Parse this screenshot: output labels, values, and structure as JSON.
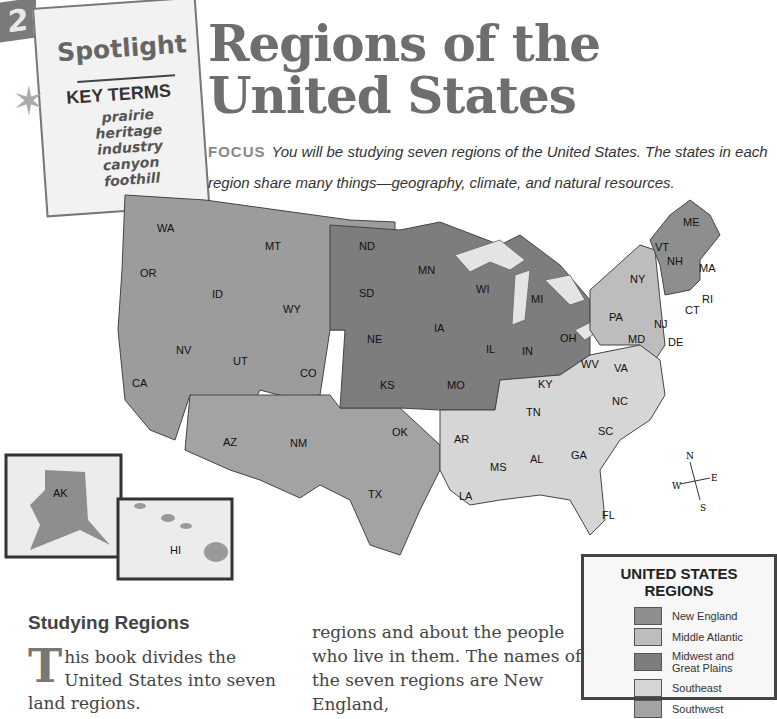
{
  "chapter_number": "2",
  "spotlight": {
    "title": "Spotlight",
    "key_terms_heading": "KEY TERMS",
    "terms": [
      "prairie",
      "heritage",
      "industry",
      "canyon",
      "foothill"
    ]
  },
  "title": {
    "line1": "Regions of the",
    "line2": "United States"
  },
  "focus": {
    "label": "FOCUS",
    "text": "You will be studying seven regions of the United States. The states in each region share many things—geography, climate, and natural resources."
  },
  "map": {
    "colors": {
      "new_england": "#8e8e8e",
      "middle_atlantic": "#bdbdbd",
      "midwest": "#7d7d7d",
      "southeast": "#d6d6d6",
      "southwest": "#a3a3a3",
      "west": "#9c9c9c",
      "water": "#e4e4e4"
    },
    "state_labels": [
      "WA",
      "OR",
      "CA",
      "ID",
      "NV",
      "MT",
      "WY",
      "UT",
      "CO",
      "AZ",
      "NM",
      "ND",
      "SD",
      "NE",
      "KS",
      "OK",
      "TX",
      "MN",
      "IA",
      "MO",
      "WI",
      "IL",
      "MI",
      "IN",
      "OH",
      "AR",
      "LA",
      "MS",
      "AL",
      "TN",
      "KY",
      "GA",
      "FL",
      "SC",
      "NC",
      "VA",
      "WV",
      "PA",
      "NY",
      "NJ",
      "MD",
      "DE",
      "CT",
      "RI",
      "MA",
      "VT",
      "NH",
      "ME",
      "AK",
      "HI"
    ],
    "compass": {
      "n": "N",
      "s": "S",
      "e": "E",
      "w": "W"
    }
  },
  "legend": {
    "title": "UNITED STATES REGIONS",
    "items": [
      {
        "label": "New England",
        "color": "#8e8e8e"
      },
      {
        "label": "Middle Atlantic",
        "color": "#bdbdbd"
      },
      {
        "label": "Midwest and Great Plains",
        "color": "#7d7d7d"
      },
      {
        "label": "Southeast",
        "color": "#d6d6d6"
      },
      {
        "label": "Southwest",
        "color": "#a3a3a3"
      }
    ]
  },
  "section": {
    "heading": "Studying Regions",
    "dropcap": "T",
    "col1": "his book divides the United States into seven land regions.",
    "col2": "regions and about the people who live in them. The names of the seven regions are New England,"
  }
}
